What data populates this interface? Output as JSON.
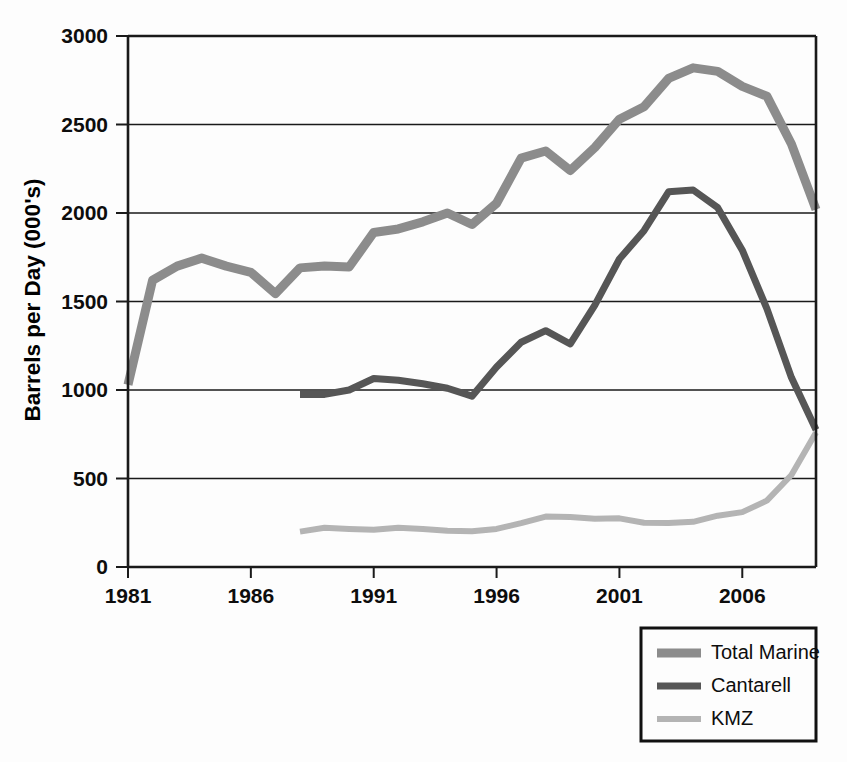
{
  "chart_data": {
    "type": "line",
    "title": "",
    "xlabel": "",
    "ylabel": "Barrels per Day (000's)",
    "xlim": [
      1981,
      2009
    ],
    "ylim": [
      0,
      3000
    ],
    "yticks": [
      0,
      500,
      1000,
      1500,
      2000,
      2500,
      3000
    ],
    "ytick_labels": [
      "0",
      "500",
      "1000",
      "1500",
      "2000",
      "2500",
      "3000"
    ],
    "xticks": [
      1981,
      1986,
      1991,
      1996,
      2001,
      2006
    ],
    "xtick_labels": [
      "1981",
      "1986",
      "1991",
      "1996",
      "2001",
      "2006"
    ],
    "grid": true,
    "legend_position": "below-right",
    "series": [
      {
        "name": "Total Marine",
        "color": "#8c8c8c",
        "line_width": 9,
        "x": [
          1981,
          1982,
          1983,
          1984,
          1985,
          1986,
          1987,
          1988,
          1989,
          1990,
          1991,
          1992,
          1993,
          1994,
          1995,
          1996,
          1997,
          1998,
          1999,
          2000,
          2001,
          2002,
          2003,
          2004,
          2005,
          2006,
          2007,
          2008,
          2009
        ],
        "values": [
          1030,
          1620,
          1700,
          1745,
          1700,
          1665,
          1545,
          1690,
          1700,
          1695,
          1890,
          1910,
          1950,
          2000,
          1935,
          2055,
          2310,
          2350,
          2240,
          2370,
          2530,
          2600,
          2760,
          2820,
          2800,
          2715,
          2660,
          2390,
          2020
        ]
      },
      {
        "name": "Cantarell",
        "color": "#565656",
        "line_width": 7,
        "x": [
          1988,
          1989,
          1990,
          1991,
          1992,
          1993,
          1994,
          1995,
          1996,
          1997,
          1998,
          1999,
          2000,
          2001,
          2002,
          2003,
          2004,
          2005,
          2006,
          2007,
          2008,
          2009
        ],
        "values": [
          975,
          975,
          1000,
          1065,
          1055,
          1035,
          1010,
          965,
          1130,
          1270,
          1335,
          1260,
          1480,
          1740,
          1900,
          2120,
          2130,
          2030,
          1790,
          1460,
          1070,
          775
        ]
      },
      {
        "name": "KMZ",
        "color": "#b4b4b4",
        "line_width": 6,
        "x": [
          1988,
          1989,
          1990,
          1991,
          1992,
          1993,
          1994,
          1995,
          1996,
          1997,
          1998,
          1999,
          2000,
          2001,
          2002,
          2003,
          2004,
          2005,
          2006,
          2007,
          2008,
          2009
        ],
        "values": [
          200,
          222,
          215,
          210,
          222,
          215,
          205,
          202,
          215,
          248,
          285,
          282,
          272,
          275,
          250,
          248,
          255,
          290,
          310,
          375,
          520,
          760
        ]
      }
    ]
  },
  "legend": {
    "items": [
      {
        "label": "Total Marine"
      },
      {
        "label": "Cantarell"
      },
      {
        "label": "KMZ"
      }
    ]
  }
}
